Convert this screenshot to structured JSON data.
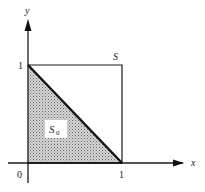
{
  "diagram": {
    "type": "region-plot",
    "axes": {
      "x_label": "x",
      "y_label": "y",
      "origin_label": "0",
      "x_tick_label": "1",
      "y_tick_label": "1"
    },
    "square": {
      "label": "S",
      "corners": [
        [
          0,
          0
        ],
        [
          1,
          0
        ],
        [
          1,
          1
        ],
        [
          0,
          1
        ]
      ]
    },
    "triangle": {
      "label_main": "S",
      "label_sub": "0",
      "vertices": [
        [
          0,
          0
        ],
        [
          1,
          0
        ],
        [
          0,
          1
        ]
      ],
      "fill": "stippled gray"
    },
    "colors": {
      "line": "#1a1a1a",
      "shade": "#b8b8b8",
      "background": "#ffffff"
    }
  }
}
